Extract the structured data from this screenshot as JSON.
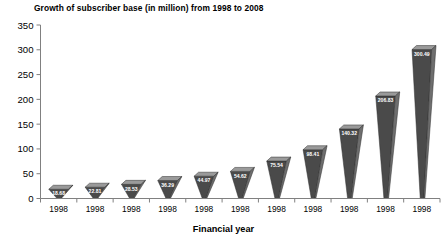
{
  "chart_data": {
    "type": "bar",
    "title": "Growth of subscriber base (in million) from 1998 to 2008",
    "xlabel": "Financial year",
    "ylabel": "",
    "categories": [
      "1998",
      "1998",
      "1998",
      "1998",
      "1998",
      "1998",
      "1998",
      "1998",
      "1998",
      "1998",
      "1998"
    ],
    "values": [
      18.68,
      22.81,
      28.53,
      36.29,
      44.97,
      54.62,
      75.54,
      98.41,
      140.32,
      206.83,
      300.49
    ],
    "value_labels": [
      "18.68",
      "22.81",
      "28.53",
      "36.29",
      "44.97",
      "54.62",
      "75.54",
      "98.41",
      "140.32",
      "206.83",
      "300.49"
    ],
    "ylim": [
      0,
      350
    ],
    "yticks": [
      0,
      50,
      100,
      150,
      200,
      250,
      300,
      350
    ],
    "ytick_labels": [
      "0",
      "50",
      "100",
      "150",
      "200",
      "250",
      "300",
      "350"
    ],
    "grid": false,
    "legend": "none",
    "style": "3d-perspective-bars",
    "colors": {
      "bar_front": "#4a4a4a",
      "bar_top": "#9a9a9a",
      "bar_side": "#6e6e6e",
      "axis": "#808080",
      "text": "#000000",
      "value_text": "#ffffff",
      "background": "#ffffff"
    }
  }
}
